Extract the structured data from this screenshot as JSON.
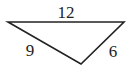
{
  "diagram": {
    "type": "triangle",
    "vertices": {
      "top_left": [
        8,
        22
      ],
      "top_right": [
        124,
        22
      ],
      "bottom": [
        81,
        64
      ]
    },
    "sides": [
      {
        "id": "top",
        "label": "12"
      },
      {
        "id": "left",
        "label": "9"
      },
      {
        "id": "right",
        "label": "6"
      }
    ],
    "stroke_color": "#222222"
  }
}
